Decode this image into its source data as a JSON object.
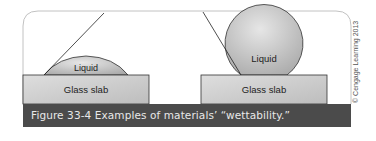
{
  "figure": {
    "caption": "Figure 33-4  Examples of materials’ “wettability.”",
    "copyright": "© Cengage Learning 2013",
    "colors": {
      "caption_bar": "#4b4b4b",
      "caption_text": "#e8e8e8",
      "slab_fill": "#cfcfcf",
      "liquid_fill": "#c4c4c4",
      "outline": "#333333",
      "frame": "#bdbdbd"
    },
    "panels": [
      {
        "name": "wetting",
        "liquid_label": "Liquid",
        "slab_label": "Glass slab",
        "description": "Low contact angle — liquid spreads into a flat dome"
      },
      {
        "name": "non-wetting",
        "liquid_label": "Liquid",
        "slab_label": "Glass slab",
        "description": "High contact angle — liquid beads into a near-sphere"
      }
    ]
  }
}
